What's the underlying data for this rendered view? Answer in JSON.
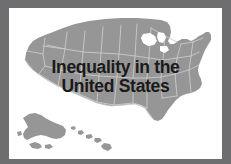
{
  "slide": {
    "title_line_1": "Inequality in the",
    "title_line_2": "United States",
    "full_title": "Inequality in the United States",
    "frame_color": "#6e6e70",
    "panel_color": "#ffffff",
    "map_fill_color": "#969696",
    "map_border_color": "#c9c9c9",
    "title_color": "#1a1a1a"
  },
  "map": {
    "name": "united-states-map",
    "regions": [
      "contiguous-united-states",
      "alaska",
      "hawaii"
    ]
  }
}
